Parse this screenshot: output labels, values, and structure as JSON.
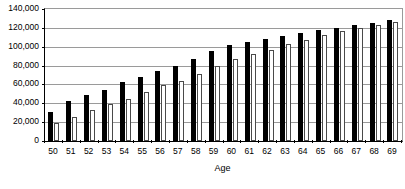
{
  "chart_data": {
    "type": "bar",
    "title": "",
    "xlabel": "Age",
    "ylabel": "",
    "ylim": [
      0,
      140000
    ],
    "ytick_step": 20000,
    "ytick_labels": [
      "140,000",
      "120,000",
      "100,000",
      "80,000",
      "60,000",
      "40,000",
      "20,000",
      "0"
    ],
    "ytick_values": [
      140000,
      120000,
      100000,
      80000,
      60000,
      40000,
      20000,
      0
    ],
    "grid": true,
    "legend": "none",
    "categories": [
      "50",
      "51",
      "52",
      "53",
      "54",
      "55",
      "56",
      "57",
      "58",
      "59",
      "60",
      "61",
      "62",
      "63",
      "64",
      "65",
      "66",
      "67",
      "68",
      "69"
    ],
    "series": [
      {
        "name": "series-a",
        "color": "#000000",
        "style": "filled-black",
        "values": [
          31000,
          42000,
          49000,
          54500,
          62500,
          68000,
          74000,
          79500,
          87500,
          95000,
          101500,
          105500,
          108500,
          111500,
          114500,
          117500,
          120000,
          123000,
          125000,
          128000
        ]
      },
      {
        "name": "series-b",
        "color": "#ffffff",
        "style": "hollow-white",
        "values": [
          19000,
          26000,
          33000,
          39000,
          45000,
          52000,
          59000,
          64000,
          71500,
          80000,
          87500,
          92500,
          97000,
          102500,
          107500,
          112000,
          116500,
          119500,
          123000,
          126000
        ]
      }
    ]
  },
  "axis": {
    "x_title": "Age"
  }
}
